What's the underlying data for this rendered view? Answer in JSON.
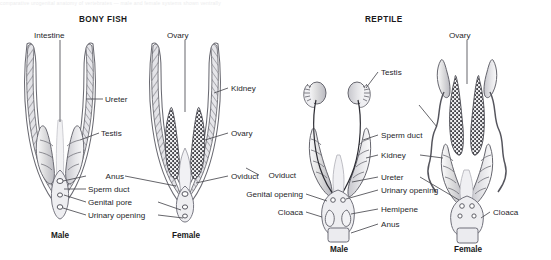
{
  "figure": {
    "top_caption_fragment": "comparative urogenital anatomy of vertebrates — male and female systems shown ventrally",
    "panels": [
      {
        "id": "bony-fish",
        "title": "BONY FISH"
      },
      {
        "id": "reptile",
        "title": "REPTILE"
      }
    ]
  },
  "sex_labels": {
    "fish_male": "Male",
    "fish_female": "Female",
    "reptile_male": "Male",
    "reptile_female": "Female"
  },
  "labels": {
    "fish": {
      "intestine": "Intestine",
      "ureter": "Ureter",
      "testis": "Testis",
      "anus": "Anus",
      "sperm_duct": "Sperm duct",
      "genital_pore": "Genital pore",
      "urinary_opening": "Urinary opening",
      "ovary_top": "Ovary",
      "kidney": "Kidney",
      "ovary_right": "Ovary",
      "oviduct": "Oviduct"
    },
    "reptile": {
      "testis": "Testis",
      "sperm_duct": "Sperm duct",
      "kidney": "Kidney",
      "ureter": "Ureter",
      "urinary_opening": "Urinary opening",
      "hemipene": "Hemipene",
      "anus": "Anus",
      "genital_opening": "Genital opening",
      "cloaca_left": "Cloaca",
      "ovary": "Ovary",
      "oviduct": "Oviduct",
      "cloaca_right": "Cloaca"
    }
  },
  "colors": {
    "ink": "#26262a",
    "leader": "#4a4a50",
    "outline": "#5b5b62",
    "organ_light": "#e9e9ec",
    "organ_mid": "#c9c9cf",
    "organ_dark": "#8e8e96",
    "granular": "#3a3a40",
    "background": "#ffffff"
  }
}
